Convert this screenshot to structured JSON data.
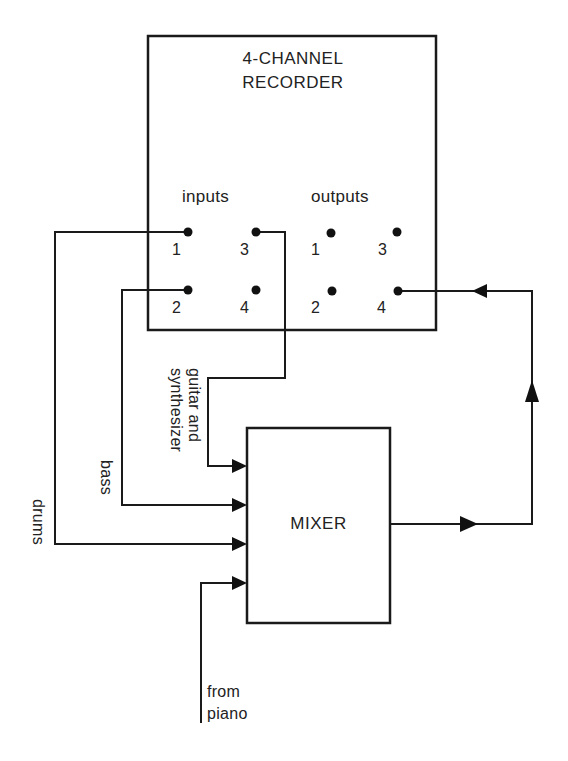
{
  "recorder": {
    "title_line1": "4-CHANNEL",
    "title_line2": "RECORDER",
    "inputs_label": "inputs",
    "outputs_label": "outputs",
    "inputs": [
      {
        "number": "1"
      },
      {
        "number": "2"
      },
      {
        "number": "3"
      },
      {
        "number": "4"
      }
    ],
    "outputs": [
      {
        "number": "1"
      },
      {
        "number": "2"
      },
      {
        "number": "3"
      },
      {
        "number": "4"
      }
    ]
  },
  "mixer": {
    "label": "MIXER"
  },
  "signals": {
    "guitar_line1": "guitar and",
    "guitar_line2": "synthesizer",
    "bass": "bass",
    "drums": "drums",
    "piano_line1": "from",
    "piano_line2": "piano"
  },
  "connections": [
    {
      "from": "recorder input 1",
      "to": "mixer input 3",
      "label": "drums"
    },
    {
      "from": "recorder input 2",
      "to": "mixer input 2",
      "label": "bass"
    },
    {
      "from": "recorder input 3",
      "to": "mixer input 1",
      "label": "guitar and synthesizer"
    },
    {
      "from": "piano",
      "to": "mixer input 4",
      "label": "from piano"
    },
    {
      "from": "mixer output",
      "to": "recorder output 4",
      "label": ""
    }
  ],
  "colors": {
    "ink": "#1a1a1a",
    "background": "#ffffff"
  }
}
